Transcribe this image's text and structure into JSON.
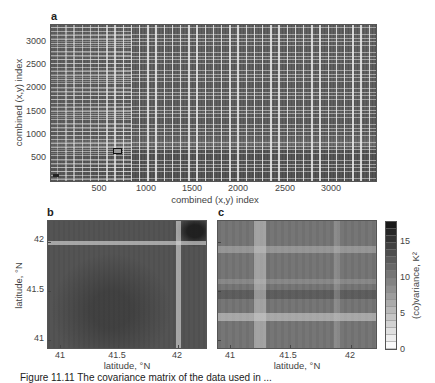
{
  "chart_data": [
    {
      "panel": "a",
      "type": "heatmap",
      "title": "",
      "xlabel": "combined (x,y) index",
      "ylabel": "combined (x,y) index",
      "xticks": [
        500,
        1000,
        1500,
        2000,
        2500,
        3000
      ],
      "yticks": [
        500,
        1000,
        1500,
        2000,
        2500,
        3000
      ],
      "xlim": [
        0,
        3400
      ],
      "ylim": [
        0,
        3400
      ],
      "colormap": "grayscale (light = low, dark = high)",
      "annotations": [
        "small rectangle marker near (680, 700)"
      ],
      "description": "Covariance matrix with periodic light vertical and horizontal stripes"
    },
    {
      "panel": "b",
      "type": "heatmap",
      "xlabel": "latitude, °N",
      "ylabel": "latitude, °N",
      "xticks": [
        41,
        41.5,
        42
      ],
      "yticks": [
        41,
        41.5,
        42
      ],
      "xlim": [
        40.9,
        42.2
      ],
      "ylim": [
        40.9,
        42.2
      ],
      "features": [
        "light band at latitude ~42 (horizontal and vertical)",
        "dark region near top-right corner"
      ]
    },
    {
      "panel": "c",
      "type": "heatmap",
      "xlabel": "latitude, °N",
      "ylabel": "",
      "xticks": [
        41,
        41.5,
        42
      ],
      "yticks": [
        41,
        41.5,
        42
      ],
      "xlim": [
        40.9,
        42.2
      ],
      "ylim": [
        40.9,
        42.2
      ],
      "features": [
        "light vertical band near 41.2",
        "light horizontal bands near 41.3 and 42.0"
      ]
    }
  ],
  "figure": {
    "panel_labels": {
      "a": "a",
      "b": "b",
      "c": "c"
    },
    "panel_a": {
      "xlabel": "combined (x,y) index",
      "ylabel": "combined (x,y) index",
      "xticks": [
        "500",
        "1000",
        "1500",
        "2000",
        "2500",
        "3000"
      ],
      "yticks": [
        "500",
        "1000",
        "1500",
        "2000",
        "2500",
        "3000"
      ]
    },
    "panel_b": {
      "xlabel": "latitude, °N",
      "ylabel": "latitude, °N",
      "xticks": [
        "41",
        "41.5",
        "42"
      ],
      "yticks": [
        "41",
        "41.5",
        "42"
      ]
    },
    "panel_c": {
      "xlabel": "latitude, °N",
      "xticks": [
        "41",
        "41.5",
        "42"
      ]
    },
    "colorbar": {
      "label": "(co)variance, K²",
      "ticks": [
        "0",
        "5",
        "10",
        "15"
      ],
      "range": [
        0,
        18
      ],
      "segments": 18
    },
    "caption": "Figure 11.11 The covariance matrix of the data used in ..."
  }
}
